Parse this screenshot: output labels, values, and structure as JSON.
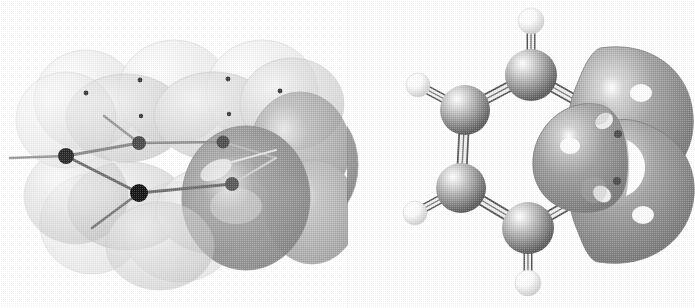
{
  "figure": {
    "background_color": "#ffffff",
    "width": 695,
    "height": 308,
    "panel_count": 2
  },
  "panels": [
    {
      "id": "left",
      "name": "atomic-p-orbital-basis-view",
      "description": "Benzene ring drawn as six carbon p atomic orbitals, each a pair of translucent grey lobes above and below the ring plane, with thin bond sticks and small dark carbon nuclei.",
      "render_style": "translucent dithered grey ellipsoids",
      "lobe_fill_far": "#e2e2e2",
      "lobe_fill_mid": "#cfcfcf",
      "lobe_fill_near": "#9a9a9a",
      "lobe_stroke": "#b4b4b4",
      "nucleus_color": "#2b2b2b",
      "bond_color": "#8e8e8e",
      "highlight_color": "#f8f8f8",
      "atom_count": 6,
      "lobe_count": 12
    },
    {
      "id": "right",
      "name": "molecular-orbital-isosurface-view",
      "description": "Benzene ball-and-stick skeleton with a grey molecular orbital isosurface envelope covering the right-hand carbons; the envelope shows two large outer lobes, a rounded inner lobe and a small white gap between them.",
      "render_style": "opaque shaded ball-and-stick with dithered grey isosurface",
      "carbon_color": "#9b9b9b",
      "carbon_highlight": "#ffffff",
      "carbon_shadow": "#5d5d5d",
      "hydrogen_color": "#f2f2f2",
      "hydrogen_shadow": "#c8c8c8",
      "bond_color": "#d8d8d8",
      "bond_outline": "#6a6a6a",
      "isosurface_color": "#9d9d9d",
      "isosurface_shadow": "#6f6f6f",
      "isosurface_highlight": "#ffffff",
      "carbon_count": 6,
      "hydrogen_count": 4
    }
  ],
  "left_panel_geometry": {
    "nuclei": [
      {
        "name": "C1",
        "x": 66,
        "y": 156,
        "r": 8.0,
        "shade": "#2a2a2a"
      },
      {
        "name": "C2",
        "x": 139,
        "y": 143,
        "r": 7.0,
        "shade": "#4a4a4a"
      },
      {
        "name": "C3",
        "x": 223,
        "y": 142,
        "r": 6.5,
        "shade": "#4f4f4f"
      },
      {
        "name": "C4",
        "x": 232,
        "y": 184,
        "r": 7.0,
        "shade": "#5a5a5a"
      },
      {
        "name": "C5",
        "x": 139,
        "y": 193,
        "r": 9.0,
        "shade": "#161616"
      },
      {
        "name": "C6",
        "x": 60,
        "y": 158,
        "r": 0.0,
        "shade": "#2a2a2a"
      }
    ],
    "dot_markers": [
      {
        "x": 86,
        "y": 93,
        "r": 2.4
      },
      {
        "x": 140,
        "y": 80,
        "r": 2.4
      },
      {
        "x": 141,
        "y": 116,
        "r": 2.2
      },
      {
        "x": 228,
        "y": 79,
        "r": 2.4
      },
      {
        "x": 229,
        "y": 114,
        "r": 2.2
      },
      {
        "x": 280,
        "y": 91,
        "r": 2.4
      }
    ]
  },
  "right_panel_geometry": {
    "carbons": [
      {
        "name": "C1",
        "x": 531,
        "y": 75,
        "r": 26
      },
      {
        "name": "C2",
        "x": 465,
        "y": 110,
        "r": 25
      },
      {
        "name": "C3",
        "x": 461,
        "y": 188,
        "r": 25
      },
      {
        "name": "C4",
        "x": 528,
        "y": 228,
        "r": 26
      },
      {
        "name": "C5",
        "x": 594,
        "y": 190,
        "r": 24
      },
      {
        "name": "C6",
        "x": 597,
        "y": 112,
        "r": 24
      }
    ],
    "hydrogens": [
      {
        "name": "H1",
        "x": 531,
        "y": 21,
        "r": 13
      },
      {
        "name": "H2",
        "x": 418,
        "y": 85,
        "r": 12
      },
      {
        "name": "H3",
        "x": 415,
        "y": 213,
        "r": 12
      },
      {
        "name": "H4",
        "x": 528,
        "y": 283,
        "r": 13
      }
    ],
    "bonds": [
      {
        "from": "C1",
        "to": "C2"
      },
      {
        "from": "C2",
        "to": "C3"
      },
      {
        "from": "C3",
        "to": "C4"
      },
      {
        "from": "C4",
        "to": "C5"
      },
      {
        "from": "C5",
        "to": "C6"
      },
      {
        "from": "C6",
        "to": "C1"
      },
      {
        "from": "C1",
        "to": "H1"
      },
      {
        "from": "C2",
        "to": "H2"
      },
      {
        "from": "C3",
        "to": "H3"
      },
      {
        "from": "C4",
        "to": "H4"
      }
    ]
  }
}
